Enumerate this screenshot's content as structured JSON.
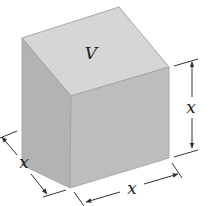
{
  "figure": {
    "type": "cube",
    "volume_label": "V",
    "dimension_labels": {
      "depth": "x",
      "width": "x",
      "height": "x"
    }
  },
  "colors": {
    "top_face": "#d6d6d6",
    "left_face": "#b3b3b3",
    "front_face": "#bdbdbd",
    "edge": "#9a9a9a",
    "line": "#333333"
  }
}
